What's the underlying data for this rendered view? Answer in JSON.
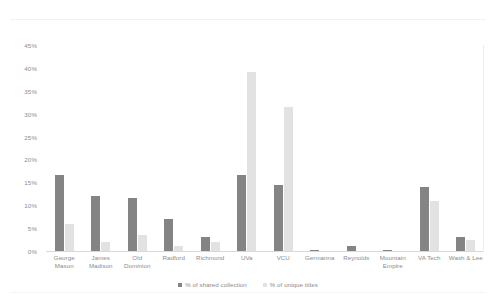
{
  "chart_data": {
    "type": "bar",
    "title": "",
    "subtitle": "",
    "xlabel": "",
    "ylabel": "",
    "ylim": [
      0,
      45
    ],
    "y_tick_step": 5,
    "grid": false,
    "legend_position": "bottom-center",
    "y_ticks": [
      "45%",
      "40%",
      "35%",
      "30%",
      "25%",
      "20%",
      "15%",
      "10%",
      "5%",
      "0%"
    ],
    "categories": [
      "George Mason",
      "James Madison",
      "Old Dominion",
      "Radford",
      "Richmond",
      "UVa",
      "VCU",
      "Germanna",
      "Reynolds",
      "Mountain Empire",
      "VA Tech",
      "Wash & Lee"
    ],
    "series": [
      {
        "name": "% of shared collection",
        "color": "#848484",
        "values": [
          16.5,
          12.0,
          11.5,
          7.0,
          3.0,
          16.5,
          14.5,
          0.3,
          1.0,
          0.3,
          14.0,
          3.0
        ]
      },
      {
        "name": "% of unique titles",
        "color": "#e2e2e2",
        "values": [
          6.0,
          2.0,
          3.5,
          1.0,
          2.0,
          39.0,
          31.5,
          0.0,
          0.0,
          0.0,
          11.0,
          2.5
        ]
      }
    ]
  },
  "legend": {
    "items": [
      {
        "label": "% of shared collection",
        "color": "#848484"
      },
      {
        "label": "% of unique titles",
        "color": "#e2e2e2"
      }
    ]
  },
  "colors": {
    "shared": "#848484",
    "unique": "#e2e2e2",
    "axis": "#d9d9d9",
    "tick_text": "#8c8c8c",
    "background": "#ffffff"
  }
}
